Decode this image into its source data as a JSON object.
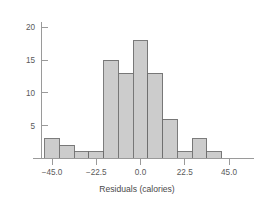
{
  "chart_data": {
    "type": "bar",
    "title": "",
    "subtitle": "",
    "xlabel": "Residuals (calories)",
    "ylabel": "",
    "xlim": [
      -52.0,
      50.0
    ],
    "ylim": [
      0,
      21.5
    ],
    "grid": false,
    "legend": null,
    "bin_width": 7.5,
    "bin_edges": [
      -48.75,
      -41.25,
      -33.75,
      -26.25,
      -18.75,
      -11.25,
      -3.75,
      3.75,
      11.25,
      18.75,
      26.25,
      33.75,
      41.25,
      48.75
    ],
    "categories": [
      "-48.75 to -41.25",
      "-41.25 to -33.75",
      "-33.75 to -26.25",
      "-26.25 to -18.75",
      "-18.75 to -11.25",
      "-11.25 to -3.75",
      "-3.75 to 3.75",
      "3.75 to 11.25",
      "11.25 to 18.75",
      "18.75 to 26.25",
      "26.25 to 33.75",
      "33.75 to 41.25",
      "41.25 to 48.75"
    ],
    "values": [
      3,
      2,
      1,
      1,
      15,
      13,
      18,
      13,
      6,
      1,
      3,
      1,
      0
    ],
    "bar_fill_color": "#cccccc",
    "bar_edge_color": "#6e6e6e",
    "xticks": [
      -45.0,
      -22.5,
      0.0,
      22.5,
      45.0
    ],
    "xtick_labels": [
      "−45.0",
      "−22.5",
      "0.0",
      "22.5",
      "45.0"
    ],
    "yticks": [
      5,
      10,
      15,
      20
    ],
    "ytick_labels": [
      "5",
      "10",
      "15",
      "20"
    ]
  },
  "axes": {
    "x_axis_label": "Residuals (calories)",
    "y_axis_label": "",
    "axis_color": "#9a9a9a",
    "tick_label_color": "#5a5a5a"
  }
}
